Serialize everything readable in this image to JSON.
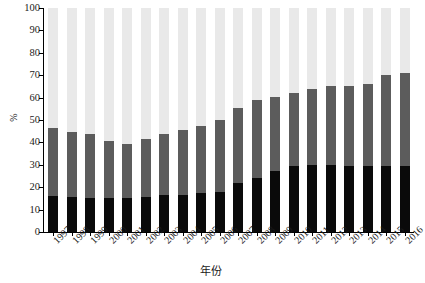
{
  "chart_data": {
    "type": "bar",
    "stacked": true,
    "title": "",
    "xlabel": "年份",
    "ylabel": "%",
    "ylim": [
      0,
      100
    ],
    "yticks": [
      0,
      10,
      20,
      30,
      40,
      50,
      60,
      70,
      80,
      90,
      100
    ],
    "grid": false,
    "legend": "none",
    "categories": [
      "1997",
      "1998",
      "1999",
      "2000",
      "2001",
      "2002",
      "2003",
      "2004",
      "2005",
      "2006",
      "2007",
      "2008",
      "2009",
      "2010",
      "2011",
      "2012",
      "2013",
      "2014",
      "2015",
      "2016"
    ],
    "series": [
      {
        "name": "low",
        "color": "#0a0a0a",
        "values": [
          16.2,
          15.8,
          15.0,
          15.3,
          15.0,
          15.8,
          16.4,
          16.5,
          17.2,
          17.8,
          21.8,
          24.2,
          27.2,
          29.3,
          30.0,
          29.8,
          29.6,
          29.6,
          29.6,
          29.5
        ]
      },
      {
        "name": "mid",
        "color": "#5c5c5c",
        "values": [
          30.3,
          28.9,
          28.6,
          25.2,
          24.4,
          25.8,
          27.2,
          29.0,
          30.0,
          32.2,
          33.4,
          34.8,
          33.0,
          32.9,
          33.8,
          35.2,
          35.4,
          36.4,
          40.6,
          41.5
        ]
      },
      {
        "name": "high",
        "color": "#e9e9e9",
        "values": [
          53.5,
          55.3,
          56.4,
          59.5,
          60.6,
          58.4,
          56.4,
          54.5,
          52.8,
          50.0,
          44.8,
          41.0,
          39.8,
          37.8,
          36.2,
          35.0,
          35.0,
          34.0,
          29.8,
          29.0
        ]
      }
    ],
    "cumulative_tops": {
      "low": [
        16.2,
        15.8,
        15.0,
        15.3,
        15.0,
        15.8,
        16.4,
        16.5,
        17.2,
        17.8,
        21.8,
        24.2,
        27.2,
        29.3,
        30.0,
        29.8,
        29.6,
        29.6,
        29.6,
        29.5
      ],
      "mid": [
        46.5,
        44.7,
        43.6,
        40.5,
        39.4,
        41.6,
        43.6,
        45.5,
        47.2,
        50.0,
        55.2,
        59.0,
        60.2,
        62.2,
        63.8,
        65.0,
        65.0,
        66.0,
        70.2,
        71.0
      ],
      "high": [
        100,
        100,
        100,
        100,
        100,
        100,
        100,
        100,
        100,
        100,
        100,
        100,
        100,
        100,
        100,
        100,
        100,
        100,
        100,
        100
      ]
    }
  }
}
